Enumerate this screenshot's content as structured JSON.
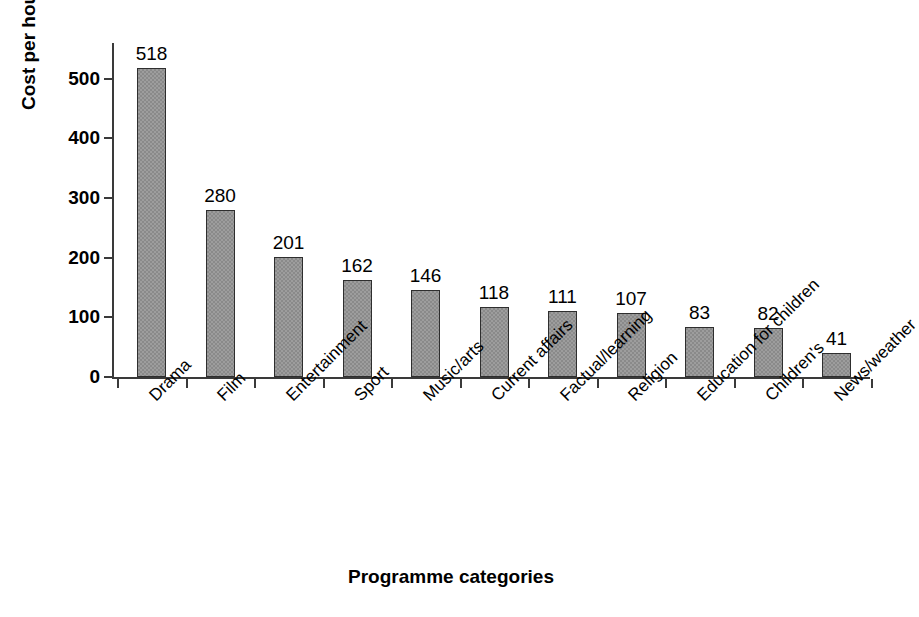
{
  "chart_data": {
    "type": "bar",
    "title": "",
    "xlabel": "Programme categories",
    "ylabel": "Cost per hour (£000s)",
    "categories": [
      "Drama",
      "Film",
      "Entertainment",
      "Sport",
      "Music/arts",
      "Current affairs",
      "Factual/learning",
      "Religion",
      "Education for children",
      "Children's",
      "News/weather"
    ],
    "values": [
      518,
      280,
      201,
      162,
      146,
      118,
      111,
      107,
      83,
      82,
      41
    ],
    "value_labels": [
      "518",
      "280",
      "201",
      "162",
      "146",
      "118",
      "111",
      "107",
      "83",
      "82",
      "41"
    ],
    "ylim": [
      0,
      560
    ],
    "yticks": [
      0,
      100,
      200,
      300,
      400,
      500
    ],
    "ytick_labels": [
      "0",
      "100",
      "200",
      "300",
      "400",
      "500"
    ],
    "grid": false,
    "legend": false,
    "bar_color": "#8a8a8a",
    "bar_border_color": "#2e2e2e",
    "axis_color": "#3a3a3a",
    "background": "#ffffff",
    "label_rotation": -45
  }
}
